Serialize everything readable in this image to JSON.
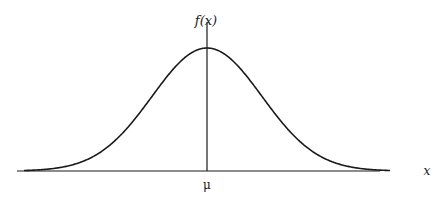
{
  "chart_data": {
    "type": "line",
    "title": "",
    "xlabel": "x",
    "ylabel": "f(x)",
    "annotations": [
      {
        "text": "μ",
        "position": "x-axis at peak"
      }
    ],
    "curve": "normal (Gaussian) probability density, symmetric about μ",
    "x_ticks": [
      "μ"
    ],
    "y_ticks": [],
    "grid": false,
    "legend": null,
    "series": [
      {
        "name": "f(x)",
        "x": [
          -3.2,
          -3,
          -2.5,
          -2,
          -1.5,
          -1,
          -0.5,
          0,
          0.5,
          1,
          1.5,
          2,
          2.5,
          3,
          3.2
        ],
        "values": [
          0.002,
          0.004,
          0.018,
          0.054,
          0.13,
          0.242,
          0.352,
          0.399,
          0.352,
          0.242,
          0.13,
          0.054,
          0.018,
          0.004,
          0.002
        ]
      }
    ]
  },
  "labels": {
    "y_axis": "f(x)",
    "x_axis": "x",
    "mean": "μ"
  },
  "colors": {
    "line": "#1a1a1a",
    "background": "#ffffff"
  }
}
